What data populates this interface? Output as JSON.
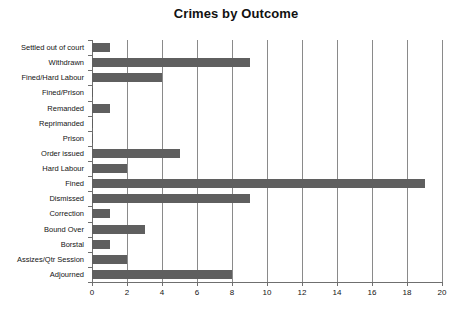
{
  "chart_data": {
    "type": "bar",
    "orientation": "horizontal",
    "title": "Crimes by Outcome",
    "xlabel": "",
    "ylabel": "",
    "xlim": [
      0,
      20
    ],
    "xticks": [
      0,
      2,
      4,
      6,
      8,
      10,
      12,
      14,
      16,
      18,
      20
    ],
    "grid": "vertical",
    "legend": "none",
    "bar_color": "#5f5f5f",
    "categories": [
      "Settled out of court",
      "Withdrawn",
      "Fined/Hard Labour",
      "Fined/Prison",
      "Remanded",
      "Reprimanded",
      "Prison",
      "Order issued",
      "Hard Labour",
      "Fined",
      "Dismissed",
      "Correction",
      "Bound Over",
      "Borstal",
      "Assizes/Qtr Session",
      "Adjourned"
    ],
    "values": [
      1,
      9,
      4,
      0,
      1,
      0,
      0,
      5,
      2,
      19,
      9,
      1,
      3,
      1,
      2,
      8
    ],
    "series": [
      {
        "name": "Crimes",
        "values": [
          1,
          9,
          4,
          0,
          1,
          0,
          0,
          5,
          2,
          19,
          9,
          1,
          3,
          1,
          2,
          8
        ]
      }
    ]
  }
}
